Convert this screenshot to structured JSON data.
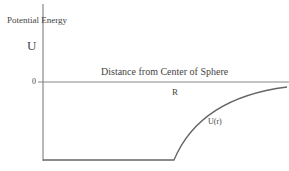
{
  "diagram": {
    "y_axis_label": "Potential Energy",
    "y_symbol": "U",
    "zero_tick": "0",
    "x_axis_label": "Distance from Center of Sphere",
    "radius_label": "R",
    "curve_label": "U(r)"
  }
}
